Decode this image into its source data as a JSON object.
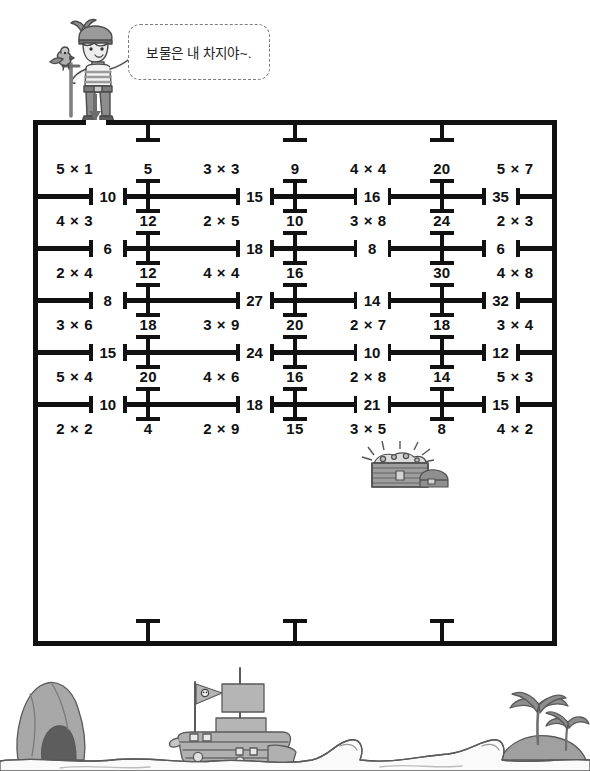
{
  "speech": {
    "text": "보물은 내 차지야~."
  },
  "icons": {
    "pirate": "pirate-boy-with-parrot-icon",
    "arrow": "down-arrow-icon",
    "treasure": "treasure-chest-icon",
    "ship": "pirate-ship-icon",
    "palm": "palm-tree-icon",
    "rock": "rock-cave-icon",
    "flag": "skull-flag-icon",
    "wave": "wave-icon"
  },
  "colors": {
    "ink": "#111111",
    "bubble_border": "#7d7d7d",
    "illustration_fill": "#b4b4b4",
    "illustration_dark": "#6e6e6e",
    "paper": "#ffffff"
  },
  "maze": {
    "columns": 7,
    "entrance_label": "entrance",
    "cell_rows": [
      {
        "id": "row-1",
        "cells": [
          "5 × 1",
          "5",
          "3 × 3",
          "9",
          "4 × 4",
          "20",
          "5 × 7"
        ]
      },
      {
        "id": "row-2",
        "cells": [
          "4 × 3",
          "12",
          "2 × 5",
          "10",
          "3 × 8",
          "24",
          "2 × 3"
        ]
      },
      {
        "id": "row-3",
        "cells": [
          "2 × 4",
          "12",
          "4 × 4",
          "16",
          "",
          "30",
          "4 × 8"
        ]
      },
      {
        "id": "row-4",
        "cells": [
          "3 × 6",
          "18",
          "3 × 9",
          "20",
          "2 × 7",
          "18",
          "3 × 4"
        ]
      },
      {
        "id": "row-5",
        "cells": [
          "5 × 4",
          "20",
          "4 × 6",
          "16",
          "2 × 8",
          "14",
          "5 × 3"
        ]
      },
      {
        "id": "row-6",
        "cells": [
          "2 × 2",
          "4",
          "2 × 9",
          "15",
          "3 × 5",
          "8",
          "4 × 2"
        ]
      }
    ],
    "wall_rows": [
      {
        "id": "wall-1",
        "numbers": [
          "10",
          "15",
          "16",
          "35"
        ]
      },
      {
        "id": "wall-2",
        "numbers": [
          "6",
          "18",
          "8",
          "6"
        ]
      },
      {
        "id": "wall-3",
        "numbers": [
          "8",
          "27",
          "14",
          "32"
        ]
      },
      {
        "id": "wall-4",
        "numbers": [
          "15",
          "24",
          "10",
          "12"
        ]
      },
      {
        "id": "wall-5",
        "numbers": [
          "10",
          "18",
          "21",
          "15"
        ]
      }
    ]
  }
}
